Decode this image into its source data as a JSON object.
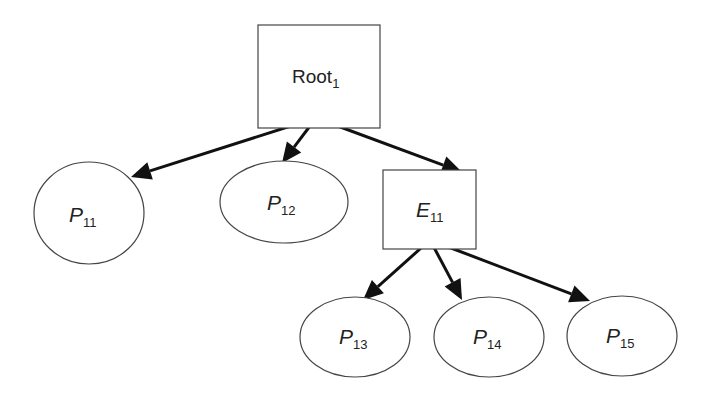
{
  "diagram": {
    "type": "tree",
    "nodes": [
      {
        "id": "root",
        "shape": "rect",
        "label": "Root",
        "sub": "1",
        "italic": false
      },
      {
        "id": "p11",
        "shape": "ellipse",
        "label": "P",
        "sub": "11",
        "italic": true
      },
      {
        "id": "p12",
        "shape": "ellipse",
        "label": "P",
        "sub": "12",
        "italic": true
      },
      {
        "id": "e11",
        "shape": "rect",
        "label": "E",
        "sub": "11",
        "italic": true
      },
      {
        "id": "p13",
        "shape": "ellipse",
        "label": "P",
        "sub": "13",
        "italic": true
      },
      {
        "id": "p14",
        "shape": "ellipse",
        "label": "P",
        "sub": "14",
        "italic": true
      },
      {
        "id": "p15",
        "shape": "ellipse",
        "label": "P",
        "sub": "15",
        "italic": true
      }
    ],
    "edges": [
      {
        "from": "root",
        "to": "p11"
      },
      {
        "from": "root",
        "to": "p12"
      },
      {
        "from": "root",
        "to": "e11"
      },
      {
        "from": "e11",
        "to": "p13"
      },
      {
        "from": "e11",
        "to": "p14"
      },
      {
        "from": "e11",
        "to": "p15"
      }
    ]
  }
}
